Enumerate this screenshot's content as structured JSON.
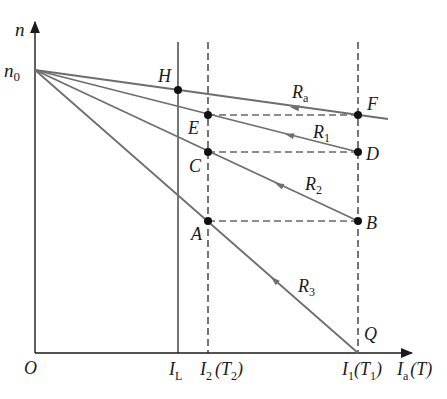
{
  "diagram": {
    "axes": {
      "y_label": "n",
      "x_label_main": "I",
      "x_label_sub": "a",
      "x_label_suffix": "(T)",
      "origin": "O",
      "n0_main": "n",
      "n0_sub": "0"
    },
    "x_ticks": [
      {
        "main": "I",
        "sub": "L",
        "suffix": ""
      },
      {
        "main": "I",
        "sub": "2",
        "suffix_open": "(T",
        "suffix_sub": "2",
        "suffix_close": ")"
      },
      {
        "main": "I",
        "sub": "1",
        "suffix_open": "(T",
        "suffix_sub": "1",
        "suffix_close": ")"
      }
    ],
    "lines": [
      {
        "name": "R",
        "sub": "a"
      },
      {
        "name": "R",
        "sub": "1"
      },
      {
        "name": "R",
        "sub": "2"
      },
      {
        "name": "R",
        "sub": "3"
      }
    ],
    "points": [
      "H",
      "E",
      "F",
      "C",
      "D",
      "A",
      "B",
      "Q"
    ],
    "colors": {
      "axis": "#1a1a1a",
      "line": "#6e6e6e",
      "dashed": "#1a1a1a",
      "point": "#111111"
    }
  }
}
